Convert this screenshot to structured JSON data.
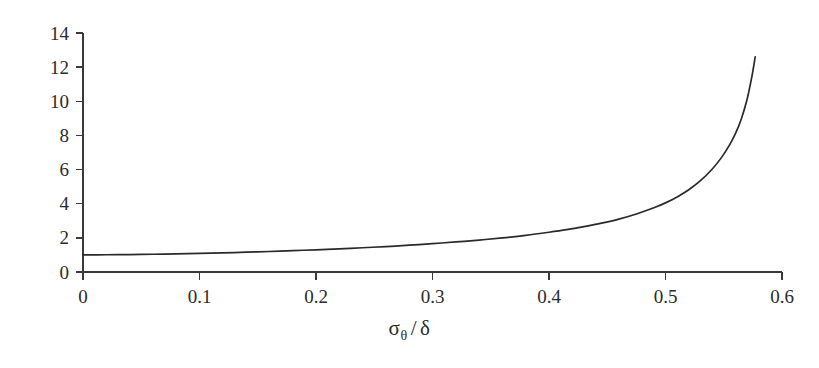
{
  "chart_data": {
    "type": "line",
    "title": "",
    "subtitle": "",
    "xlabel": "σθ / δ",
    "xlabel_parts": {
      "base": "σ",
      "subscript": "θ",
      "separator": "/",
      "denominator": "δ"
    },
    "ylabel": "",
    "xlim": [
      0,
      0.6
    ],
    "ylim": [
      0,
      14
    ],
    "xticks": [
      0,
      0.1,
      0.2,
      0.3,
      0.4,
      0.5,
      0.6
    ],
    "xtick_labels": [
      "0",
      "0.1",
      "0.2",
      "0.3",
      "0.4",
      "0.5",
      "0.6"
    ],
    "yticks": [
      0,
      2,
      4,
      6,
      8,
      10,
      12,
      14
    ],
    "ytick_labels": [
      "0",
      "2",
      "4",
      "6",
      "8",
      "10",
      "12",
      "14"
    ],
    "grid": false,
    "legend": null,
    "legend_position": "none",
    "series": [
      {
        "name": "curve",
        "color": "#2a2a2a",
        "x": [
          0.0,
          0.02,
          0.04,
          0.06,
          0.08,
          0.1,
          0.12,
          0.14,
          0.16,
          0.18,
          0.2,
          0.22,
          0.24,
          0.26,
          0.28,
          0.3,
          0.32,
          0.34,
          0.36,
          0.38,
          0.4,
          0.415,
          0.43,
          0.445,
          0.46,
          0.475,
          0.49,
          0.5,
          0.51,
          0.52,
          0.53,
          0.54,
          0.548,
          0.555,
          0.56,
          0.565,
          0.57,
          0.574,
          0.577
        ],
        "y": [
          1.0,
          1.01,
          1.02,
          1.04,
          1.06,
          1.09,
          1.12,
          1.16,
          1.2,
          1.25,
          1.3,
          1.36,
          1.42,
          1.49,
          1.57,
          1.66,
          1.76,
          1.87,
          2.0,
          2.15,
          2.33,
          2.48,
          2.66,
          2.86,
          3.1,
          3.4,
          3.76,
          4.05,
          4.4,
          4.82,
          5.35,
          6.02,
          6.7,
          7.45,
          8.1,
          8.95,
          10.1,
          11.4,
          12.6
        ]
      }
    ],
    "axis_style": {
      "spines": [
        "left",
        "bottom"
      ],
      "tick_direction": "out",
      "axis_color": "#3a3a3a"
    },
    "background_color": "#ffffff"
  },
  "figure": {
    "width": 819,
    "height": 368,
    "plot_area": {
      "left": 83,
      "right": 782,
      "top": 33,
      "bottom": 272
    }
  }
}
